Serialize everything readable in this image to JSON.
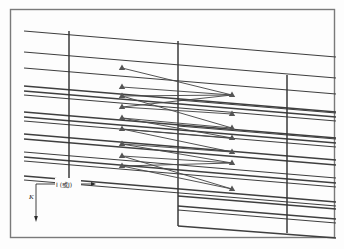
{
  "figure": {
    "kind": "engineering-lattice-diagram",
    "background_color": "#fdfdfd",
    "line_color": "#3a3a3a",
    "heavy_line_color": "#2a2a2a",
    "marker_color": "#555555",
    "border_color": "#6b6b6b",
    "frame": {
      "x": 10,
      "y": 9,
      "width": 325,
      "height": 229
    },
    "axes": {
      "origin": {
        "x": 36,
        "y": 184
      },
      "horizontal_label": "I (或J)",
      "horizontal_label_parts": {
        "latin": "I",
        "cjk": "(或",
        "latin2": "J)"
      },
      "vertical_label": "K",
      "horizontal_arrow_end": {
        "x": 96,
        "y": 184
      },
      "vertical_arrow_end": {
        "x": 36,
        "y": 222
      }
    },
    "grid": {
      "description": "family of near-parallel lines sloping down to the right",
      "slope": 0.082,
      "line_count": 24
    },
    "vertical_lines": [
      {
        "name": "left-column-divider",
        "x": 69,
        "y_top": 31,
        "y_bottom": 181
      },
      {
        "name": "center-column-divider",
        "x": 178,
        "y_top": 41,
        "y_bottom": 226
      },
      {
        "name": "right-column-divider",
        "x": 287,
        "y_top": 75,
        "y_bottom": 233
      }
    ],
    "markers": {
      "glyph": "triangle-up",
      "left_column_x": 122,
      "right_column_x": 232,
      "left_column_y": [
        68,
        87,
        96,
        107,
        118,
        129,
        144,
        156,
        166
      ],
      "right_column_y": [
        95,
        114,
        128,
        138,
        152,
        163,
        189
      ]
    },
    "connections": [
      {
        "from": [
          122,
          68
        ],
        "to": [
          232,
          95
        ]
      },
      {
        "from": [
          122,
          87
        ],
        "to": [
          232,
          95
        ]
      },
      {
        "from": [
          122,
          96
        ],
        "to": [
          232,
          95
        ]
      },
      {
        "from": [
          122,
          107
        ],
        "to": [
          232,
          95
        ]
      },
      {
        "from": [
          122,
          107
        ],
        "to": [
          232,
          114
        ]
      },
      {
        "from": [
          122,
          96
        ],
        "to": [
          232,
          128
        ]
      },
      {
        "from": [
          122,
          118
        ],
        "to": [
          232,
          128
        ]
      },
      {
        "from": [
          122,
          118
        ],
        "to": [
          232,
          138
        ]
      },
      {
        "from": [
          122,
          129
        ],
        "to": [
          232,
          138
        ]
      },
      {
        "from": [
          122,
          129
        ],
        "to": [
          232,
          152
        ]
      },
      {
        "from": [
          122,
          144
        ],
        "to": [
          232,
          152
        ]
      },
      {
        "from": [
          122,
          144
        ],
        "to": [
          232,
          163
        ]
      },
      {
        "from": [
          122,
          156
        ],
        "to": [
          232,
          163
        ]
      },
      {
        "from": [
          122,
          166
        ],
        "to": [
          232,
          163
        ]
      },
      {
        "from": [
          122,
          166
        ],
        "to": [
          232,
          189
        ]
      },
      {
        "from": [
          122,
          156
        ],
        "to": [
          232,
          189
        ]
      }
    ]
  }
}
